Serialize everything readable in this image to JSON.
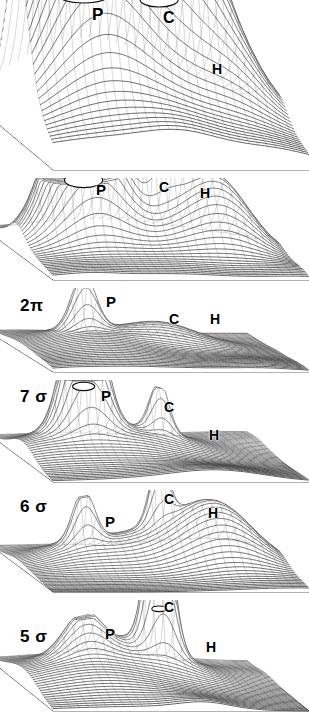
{
  "figure": {
    "kind": "stacked-3d-surface-panels",
    "panel_count": 6,
    "background_color": "#ffffff",
    "ink_color": "#000000",
    "surface_style": "grayscale wireframe mesh with halftone shading",
    "peak_legend": [
      "P",
      "C",
      "H"
    ]
  },
  "panels": [
    {
      "id": "panel-1",
      "level_label": "",
      "top": 0,
      "height": 178,
      "peaks": [
        {
          "letter": "P",
          "x": 92,
          "y": 6,
          "size": 17,
          "shape": "truncated-cylinder",
          "height": 1.0,
          "width": 0.2,
          "flat_top": true
        },
        {
          "letter": "C",
          "x": 163,
          "y": 10,
          "size": 16,
          "shape": "truncated-cylinder",
          "height": 0.94,
          "width": 0.13,
          "flat_top": true
        },
        {
          "letter": "H",
          "x": 212,
          "y": 62,
          "size": 14,
          "shape": "dome",
          "height": 0.48,
          "width": 0.13,
          "flat_top": false
        }
      ]
    },
    {
      "id": "panel-2",
      "level_label": "",
      "top": 178,
      "height": 110,
      "peaks": [
        {
          "letter": "P",
          "x": 96,
          "y": 4,
          "size": 15,
          "shape": "truncated-cylinder",
          "height": 0.72,
          "width": 0.13,
          "flat_top": true
        },
        {
          "letter": "C",
          "x": 159,
          "y": 2,
          "size": 14,
          "shape": "truncated-cylinder",
          "height": 0.78,
          "width": 0.06,
          "flat_top": true
        },
        {
          "letter": "H",
          "x": 200,
          "y": 8,
          "size": 14,
          "shape": "dome",
          "height": 0.62,
          "width": 0.13,
          "flat_top": false
        }
      ]
    },
    {
      "id": "panel-3",
      "level_label": "2π",
      "top": 288,
      "height": 92,
      "peaks": [
        {
          "letter": "P",
          "x": 106,
          "y": 6,
          "size": 15,
          "shape": "spike",
          "height": 0.72,
          "width": 0.045,
          "flat_top": false
        },
        {
          "letter": "C",
          "x": 169,
          "y": 24,
          "size": 14,
          "shape": "dome",
          "height": 0.22,
          "width": 0.12,
          "flat_top": false
        },
        {
          "letter": "H",
          "x": 210,
          "y": 24,
          "size": 14,
          "shape": "flat",
          "height": 0.02,
          "width": 0.12,
          "flat_top": false
        }
      ]
    },
    {
      "id": "panel-4",
      "level_label": "7 σ",
      "top": 380,
      "height": 110,
      "peaks": [
        {
          "letter": "P",
          "x": 101,
          "y": 8,
          "size": 15,
          "shape": "column",
          "height": 0.68,
          "width": 0.075,
          "flat_top": true
        },
        {
          "letter": "C",
          "x": 164,
          "y": 20,
          "size": 14,
          "shape": "spike",
          "height": 0.56,
          "width": 0.035,
          "flat_top": false
        },
        {
          "letter": "H",
          "x": 209,
          "y": 48,
          "size": 14,
          "shape": "flat",
          "height": 0.02,
          "width": 0.12,
          "flat_top": false
        }
      ]
    },
    {
      "id": "panel-5",
      "level_label": "6 σ",
      "top": 490,
      "height": 110,
      "peaks": [
        {
          "letter": "P",
          "x": 105,
          "y": 24,
          "size": 15,
          "shape": "spike",
          "height": 0.56,
          "width": 0.04,
          "flat_top": false
        },
        {
          "letter": "C",
          "x": 164,
          "y": 2,
          "size": 14,
          "shape": "spike",
          "height": 0.7,
          "width": 0.035,
          "flat_top": false
        },
        {
          "letter": "H",
          "x": 208,
          "y": 16,
          "size": 14,
          "shape": "dome",
          "height": 0.5,
          "width": 0.14,
          "flat_top": false
        }
      ]
    },
    {
      "id": "panel-6",
      "level_label": "5 σ",
      "top": 600,
      "height": 119,
      "peaks": [
        {
          "letter": "P",
          "x": 105,
          "y": 26,
          "size": 15,
          "shape": "bell",
          "height": 0.44,
          "width": 0.06,
          "flat_top": false
        },
        {
          "letter": "C",
          "x": 164,
          "y": 0,
          "size": 14,
          "shape": "column",
          "height": 0.66,
          "width": 0.05,
          "flat_top": true
        },
        {
          "letter": "H",
          "x": 206,
          "y": 40,
          "size": 14,
          "shape": "flat",
          "height": 0.02,
          "width": 0.12,
          "flat_top": false
        }
      ]
    }
  ],
  "level_labels": [
    {
      "text": "2π",
      "x": 20,
      "y": 297,
      "size": 17
    },
    {
      "text": "7 σ",
      "x": 20,
      "y": 388,
      "size": 17
    },
    {
      "text": "6 σ",
      "x": 20,
      "y": 498,
      "size": 17
    },
    {
      "text": "5 σ",
      "x": 20,
      "y": 628,
      "size": 17
    }
  ]
}
